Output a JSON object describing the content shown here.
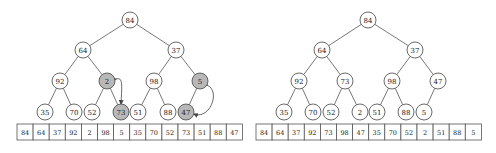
{
  "colors": {
    "highlight_fill": "#b8b8b8",
    "normal_fill": "#ffffff",
    "stroke": "#444444"
  },
  "left": {
    "nodes": [
      {
        "id": 0,
        "value": "84",
        "x": 130,
        "y": 20,
        "highlight": false
      },
      {
        "id": 1,
        "value": "64",
        "x": 83,
        "y": 50,
        "highlight": false
      },
      {
        "id": 2,
        "value": "37",
        "x": 176,
        "y": 50,
        "highlight": false
      },
      {
        "id": 3,
        "value": "92",
        "x": 60,
        "y": 81,
        "highlight": false
      },
      {
        "id": 4,
        "value": "2",
        "x": 107,
        "y": 81,
        "highlight": true
      },
      {
        "id": 5,
        "value": "98",
        "x": 154,
        "y": 81,
        "highlight": false
      },
      {
        "id": 6,
        "value": "5",
        "x": 200,
        "y": 81,
        "highlight": true
      },
      {
        "id": 7,
        "value": "35",
        "x": 45,
        "y": 112,
        "highlight": false
      },
      {
        "id": 8,
        "value": "70",
        "x": 74,
        "y": 112,
        "highlight": false
      },
      {
        "id": 9,
        "value": "52",
        "x": 92,
        "y": 112,
        "highlight": false
      },
      {
        "id": 10,
        "value": "73",
        "x": 121,
        "y": 112,
        "highlight": true
      },
      {
        "id": 11,
        "value": "51",
        "x": 138,
        "y": 112,
        "highlight": false
      },
      {
        "id": 12,
        "value": "88",
        "x": 168,
        "y": 112,
        "highlight": false
      },
      {
        "id": 13,
        "value": "47",
        "x": 186,
        "y": 112,
        "highlight": true
      }
    ],
    "swaps": [
      {
        "from": 4,
        "to": 10
      },
      {
        "from": 6,
        "to": 13
      }
    ],
    "array": {
      "x": 17,
      "y": 124,
      "cell_w": 16.1,
      "cell_h": 16,
      "values": [
        "84",
        "64",
        "37",
        "92",
        "2",
        "98",
        "5",
        "35",
        "70",
        "52",
        "73",
        "51",
        "88",
        "47"
      ]
    }
  },
  "right": {
    "nodes": [
      {
        "id": 0,
        "value": "84",
        "x": 368,
        "y": 20,
        "highlight": false
      },
      {
        "id": 1,
        "value": "64",
        "x": 322,
        "y": 50,
        "highlight": false
      },
      {
        "id": 2,
        "value": "37",
        "x": 415,
        "y": 50,
        "highlight": false
      },
      {
        "id": 3,
        "value": "92",
        "x": 299,
        "y": 81,
        "highlight": false
      },
      {
        "id": 4,
        "value": "73",
        "x": 345,
        "y": 81,
        "highlight": false
      },
      {
        "id": 5,
        "value": "98",
        "x": 392,
        "y": 81,
        "highlight": false
      },
      {
        "id": 6,
        "value": "47",
        "x": 438,
        "y": 81,
        "highlight": false
      },
      {
        "id": 7,
        "value": "35",
        "x": 284,
        "y": 112,
        "highlight": false
      },
      {
        "id": 8,
        "value": "70",
        "x": 313,
        "y": 112,
        "highlight": false
      },
      {
        "id": 9,
        "value": "52",
        "x": 331,
        "y": 112,
        "highlight": false
      },
      {
        "id": 10,
        "value": "2",
        "x": 360,
        "y": 112,
        "highlight": false
      },
      {
        "id": 11,
        "value": "51",
        "x": 377,
        "y": 112,
        "highlight": false
      },
      {
        "id": 12,
        "value": "88",
        "x": 406,
        "y": 112,
        "highlight": false
      },
      {
        "id": 13,
        "value": "5",
        "x": 424,
        "y": 112,
        "highlight": false
      }
    ],
    "swaps": [],
    "array": {
      "x": 256,
      "y": 124,
      "cell_w": 16.1,
      "cell_h": 16,
      "values": [
        "84",
        "64",
        "37",
        "92",
        "73",
        "98",
        "47",
        "35",
        "70",
        "52",
        "2",
        "51",
        "88",
        "5"
      ]
    }
  }
}
